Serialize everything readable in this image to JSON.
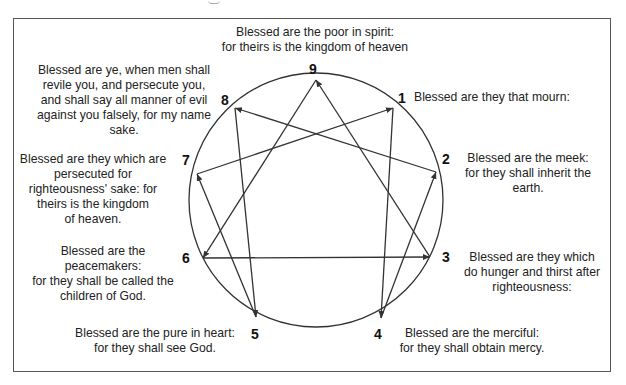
{
  "diagram": {
    "type": "enneagram",
    "circle": {
      "cx": 316,
      "cy": 200,
      "r": 127
    },
    "points": [
      {
        "id": "9",
        "x": 316,
        "y": 80
      },
      {
        "id": "1",
        "x": 393,
        "y": 108
      },
      {
        "id": "2",
        "x": 436,
        "y": 172
      },
      {
        "id": "3",
        "x": 430,
        "y": 257
      },
      {
        "id": "4",
        "x": 381,
        "y": 318
      },
      {
        "id": "5",
        "x": 256,
        "y": 317
      },
      {
        "id": "6",
        "x": 203,
        "y": 258
      },
      {
        "id": "7",
        "x": 197,
        "y": 174
      },
      {
        "id": "8",
        "x": 235,
        "y": 108
      }
    ],
    "arrows": [
      {
        "from": "9",
        "to": "6"
      },
      {
        "from": "6",
        "to": "3"
      },
      {
        "from": "3",
        "to": "9"
      },
      {
        "from": "1",
        "to": "4"
      },
      {
        "from": "4",
        "to": "2"
      },
      {
        "from": "2",
        "to": "8"
      },
      {
        "from": "8",
        "to": "5"
      },
      {
        "from": "5",
        "to": "7"
      },
      {
        "from": "7",
        "to": "1"
      }
    ],
    "numbers": {
      "n9": "9",
      "n1": "1",
      "n2": "2",
      "n3": "3",
      "n4": "4",
      "n5": "5",
      "n6": "6",
      "n7": "7",
      "n8": "8"
    },
    "captions": {
      "c9": [
        "Blessed are the poor in spirit:",
        "for theirs is the kingdom of heaven"
      ],
      "c1": [
        "Blessed are they that mourn:"
      ],
      "c2": [
        "Blessed are the meek:",
        "for they shall inherit the",
        "earth."
      ],
      "c3": [
        "Blessed are they which",
        "do hunger and thirst after",
        "righteousness:"
      ],
      "c4": [
        "Blessed are the merciful:",
        "for they shall obtain mercy."
      ],
      "c5": [
        "Blessed are the pure in heart:",
        "for they shall see God."
      ],
      "c6": [
        "Blessed are the",
        "peacemakers:",
        "for they shall be called the",
        "children of God."
      ],
      "c7": [
        "Blessed are they which are",
        "persecuted for",
        "righteousness' sake: for",
        "theirs is the kingdom",
        "of heaven."
      ],
      "c8": [
        "Blessed are ye, when men shall",
        "revile you, and persecute you,",
        "and shall say all manner of evil",
        "against you falsely, for my name",
        "sake."
      ]
    },
    "colors": {
      "line": "#333333",
      "text": "#222222",
      "border": "#555555"
    }
  }
}
